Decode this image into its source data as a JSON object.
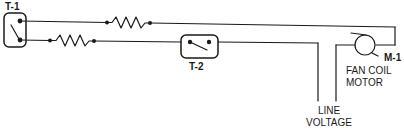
{
  "diagram": {
    "components": {
      "t1": {
        "label": "T-1"
      },
      "t2": {
        "label": "T-2"
      },
      "m1": {
        "label": "M-1",
        "description_line1": "FAN COIL",
        "description_line2": "MOTOR"
      }
    },
    "line_voltage": {
      "line1": "LINE",
      "line2": "VOLTAGE"
    },
    "colors": {
      "stroke": "#1a1a1a",
      "background": "#ffffff"
    }
  }
}
